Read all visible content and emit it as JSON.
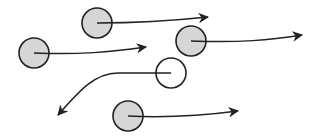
{
  "diagram": {
    "colors": {
      "background": "#ffffff",
      "stroke": "#222222",
      "filled_particle": "#d6d6d6",
      "empty_particle": "#ffffff"
    },
    "particles": [
      {
        "id": "p1",
        "cx": 97,
        "cy": 23,
        "r": 15,
        "filled": true,
        "arrow": "M97,23 C140,23 170,21 208,17"
      },
      {
        "id": "p2",
        "cx": 34,
        "cy": 53,
        "r": 15,
        "filled": true,
        "arrow": "M34,53 C80,55 110,52 146,47"
      },
      {
        "id": "p3",
        "cx": 191,
        "cy": 41,
        "r": 15,
        "filled": true,
        "arrow": "M191,41 C240,43 270,40 302,35"
      },
      {
        "id": "p4",
        "cx": 171,
        "cy": 73,
        "r": 15,
        "filled": false,
        "arrow": "M171,73 L118,73 C95,73 80,90 58,115"
      },
      {
        "id": "p5",
        "cx": 128,
        "cy": 116,
        "r": 15,
        "filled": true,
        "arrow": "M128,116 C170,118 200,116 238,111"
      }
    ]
  }
}
